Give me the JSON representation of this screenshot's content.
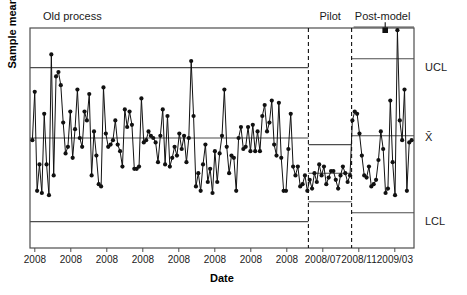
{
  "chart_data": {
    "type": "line",
    "title": "",
    "xlabel": "Date",
    "ylabel": "Sample mean",
    "grid": false,
    "legend_position": "none",
    "xlim": [
      0,
      160
    ],
    "ylim": [
      0,
      100
    ],
    "xtick_labels": [
      "2008",
      "2008",
      "2008",
      "2008",
      "2008",
      "2008",
      "2008",
      "2008",
      "2008/07",
      "2008/11",
      "2009/03"
    ],
    "xtick_positions": [
      2,
      17,
      32,
      47,
      62,
      77,
      92,
      107,
      122,
      137,
      152
    ],
    "phases": [
      {
        "name": "Old process",
        "x_start": 0,
        "x_end": 116,
        "ucl": 82,
        "center": 50,
        "lcl": 12
      },
      {
        "name": "Pilot",
        "x_start": 116,
        "x_end": 134,
        "ucl": 47,
        "center": 34,
        "lcl": 21
      },
      {
        "name": "Post-model",
        "x_start": 134,
        "x_end": 160,
        "ucl": 86,
        "center": 51,
        "lcl": 16
      }
    ],
    "phase_divider_x": [
      116,
      134
    ],
    "limit_labels": {
      "ucl": "UCL",
      "center": "X̄",
      "lcl": "LCL"
    },
    "out_of_control_points": [
      {
        "x": 148,
        "y": 99,
        "marker": "square"
      }
    ],
    "series": [
      {
        "name": "Sample mean",
        "marker": "filled-circle",
        "values": [
          49,
          71,
          26,
          38,
          25,
          61,
          38,
          24,
          88,
          33,
          78,
          80,
          74,
          57,
          43,
          46,
          62,
          41,
          54,
          72,
          50,
          46,
          62,
          58,
          70,
          33,
          53,
          42,
          29,
          28,
          73,
          52,
          46,
          47,
          49,
          58,
          47,
          44,
          37,
          63,
          55,
          62,
          56,
          36,
          36,
          37,
          68,
          48,
          49,
          53,
          51,
          50,
          48,
          39,
          51,
          63,
          38,
          60,
          37,
          41,
          46,
          42,
          52,
          45,
          51,
          39,
          50,
          85,
          60,
          28,
          34,
          26,
          38,
          47,
          30,
          36,
          25,
          44,
          30,
          43,
          51,
          72,
          46,
          34,
          42,
          41,
          26,
          50,
          55,
          45,
          46,
          55,
          44,
          56,
          44,
          53,
          44,
          60,
          65,
          53,
          57,
          67,
          47,
          42,
          66,
          41,
          26,
          26,
          45,
          61,
          37,
          33,
          37,
          28,
          29,
          33,
          26,
          31,
          27,
          34,
          30,
          38,
          33,
          37,
          29,
          32,
          35,
          35,
          31,
          27,
          33,
          37,
          34,
          30,
          33,
          58,
          62,
          61,
          52,
          42,
          33,
          32,
          37,
          28,
          29,
          31,
          40,
          53,
          45,
          25,
          27,
          67,
          39,
          24,
          99,
          58,
          49,
          72,
          26,
          48,
          49
        ]
      }
    ]
  },
  "axis_titles": {
    "x": "Date",
    "y": "Sample mean"
  }
}
